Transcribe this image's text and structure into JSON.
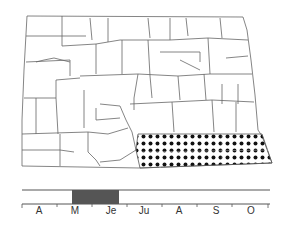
{
  "map": {
    "region": "North Dakota counties",
    "shaded_area": "southeastern counties",
    "pattern": "dot stipple",
    "colors": {
      "outline": "#555555",
      "dots": "#111111",
      "background": "#ffffff"
    }
  },
  "timeline": {
    "months": [
      "A",
      "M",
      "Je",
      "Ju",
      "A",
      "S",
      "O"
    ],
    "active_period": {
      "start": "M",
      "end": "Je"
    },
    "bar_color": "#555555"
  }
}
